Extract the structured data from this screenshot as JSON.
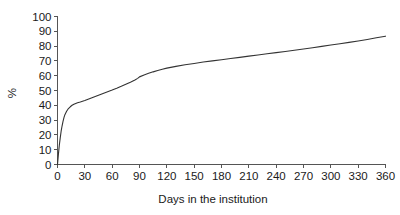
{
  "figure": {
    "background_color": "#ffffff",
    "line_color": "#333333",
    "axis_color": "#555555",
    "text_color": "#1a1a1a"
  },
  "chart_data": {
    "type": "line",
    "title": "",
    "subtitle": "",
    "xlabel": "Days in the institution",
    "ylabel": "%",
    "xlim": [
      0,
      360
    ],
    "ylim": [
      0,
      100
    ],
    "xticks": [
      0,
      30,
      60,
      90,
      120,
      150,
      180,
      210,
      240,
      270,
      300,
      330,
      360
    ],
    "xticklabels": [
      "0",
      "30",
      "60",
      "90",
      "120",
      "150",
      "180",
      "210",
      "240",
      "270",
      "300",
      "330",
      "360"
    ],
    "yticks": [
      0,
      10,
      20,
      30,
      40,
      50,
      60,
      70,
      80,
      90,
      100
    ],
    "yticklabels": [
      "0",
      "10",
      "20",
      "30",
      "40",
      "50",
      "60",
      "70",
      "80",
      "90",
      "100"
    ],
    "grid": false,
    "legend": false,
    "legend_position": "none",
    "series": [
      {
        "name": "cumulative percentage",
        "x": [
          0,
          1,
          2,
          3,
          4,
          5,
          6,
          7,
          8,
          10,
          12,
          14,
          16,
          18,
          20,
          22,
          25,
          30,
          35,
          40,
          45,
          50,
          55,
          60,
          65,
          70,
          75,
          80,
          85,
          88,
          90,
          95,
          100,
          105,
          110,
          115,
          120,
          130,
          140,
          150,
          160,
          170,
          180,
          190,
          200,
          210,
          220,
          230,
          240,
          250,
          260,
          270,
          280,
          290,
          300,
          310,
          320,
          330,
          340,
          350,
          360
        ],
        "y": [
          0,
          7,
          13,
          18,
          22.5,
          26,
          29,
          31.5,
          33.5,
          36,
          37.8,
          39,
          40,
          40.7,
          41.2,
          41.7,
          42.2,
          43.2,
          44.4,
          45.6,
          46.8,
          48,
          49.2,
          50.3,
          51.5,
          52.8,
          54.2,
          55.6,
          57.1,
          58.2,
          59.2,
          60.5,
          61.6,
          62.6,
          63.5,
          64.3,
          65.1,
          66.3,
          67.4,
          68.3,
          69.2,
          70,
          70.8,
          71.6,
          72.4,
          73.2,
          74,
          74.8,
          75.6,
          76.4,
          77.2,
          78,
          78.9,
          79.8,
          80.7,
          81.6,
          82.5,
          83.5,
          84.5,
          85.6,
          86.7
        ]
      }
    ]
  }
}
